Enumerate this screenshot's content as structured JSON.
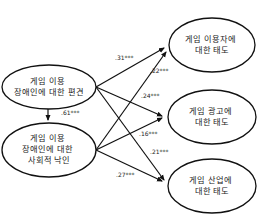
{
  "diagram": {
    "type": "path-model",
    "nodes": {
      "prejudice": {
        "lines": [
          "게임 이용",
          "장애인에 대한 편견"
        ]
      },
      "stigma": {
        "lines": [
          "게임 이용",
          "장애인에 대한",
          "사회적 낙인"
        ]
      },
      "attitude_users": {
        "lines": [
          "게임 이용자에",
          "대한 태도"
        ]
      },
      "attitude_ads": {
        "lines": [
          "게임 광고에",
          "대한 태도"
        ]
      },
      "attitude_industry": {
        "lines": [
          "게임 산업에",
          "대한 태도"
        ]
      }
    },
    "edges": {
      "prejudice_to_stigma": {
        "from": "prejudice",
        "to": "stigma",
        "coef": ".61***"
      },
      "prejudice_to_users": {
        "from": "prejudice",
        "to": "attitude_users",
        "coef": ".31***"
      },
      "stigma_to_users": {
        "from": "stigma",
        "to": "attitude_users",
        "coef": ".22***"
      },
      "prejudice_to_ads": {
        "from": "prejudice",
        "to": "attitude_ads",
        "coef": ".24***"
      },
      "stigma_to_ads": {
        "from": "stigma",
        "to": "attitude_ads",
        "coef": ".16***"
      },
      "prejudice_to_industry": {
        "from": "prejudice",
        "to": "attitude_industry",
        "coef": ".21***"
      },
      "stigma_to_industry": {
        "from": "stigma",
        "to": "attitude_industry",
        "coef": ".27***"
      }
    },
    "colors": {
      "stroke": "#111111",
      "text": "#222222",
      "background": "#ffffff"
    }
  }
}
